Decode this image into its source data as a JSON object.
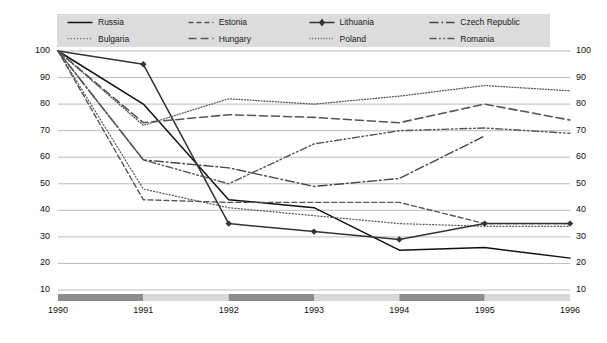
{
  "legend": {
    "items": [
      {
        "name": "Russia",
        "style": "solid",
        "color": "#111111",
        "marker": "none"
      },
      {
        "name": "Bulgaria",
        "style": "fine-dotted",
        "color": "#555555",
        "marker": "none"
      },
      {
        "name": "Estonia",
        "style": "dashed",
        "color": "#555555",
        "marker": "none"
      },
      {
        "name": "Hungary",
        "style": "long-dash",
        "color": "#555555",
        "marker": "none"
      },
      {
        "name": "Lithuania",
        "style": "solid",
        "color": "#333333",
        "marker": "diamond"
      },
      {
        "name": "Poland",
        "style": "dotted",
        "color": "#555555",
        "marker": "none"
      },
      {
        "name": "Czech Republic",
        "style": "dash-dot",
        "color": "#444444",
        "marker": "none"
      },
      {
        "name": "Romania",
        "style": "dash-dot-dot",
        "color": "#555555",
        "marker": "none"
      }
    ]
  },
  "axes": {
    "y_ticks_left": [
      "100",
      "90",
      "80",
      "70",
      "60",
      "50",
      "40",
      "30",
      "20",
      "10"
    ],
    "y_ticks_right": [
      "100",
      "90",
      "80",
      "70",
      "60",
      "50",
      "40",
      "30",
      "20",
      "10"
    ],
    "x_ticks": [
      "1990",
      "1991",
      "1992",
      "1993",
      "1994",
      "1995",
      "1996"
    ]
  },
  "colors": {
    "legend_background": "#dcdcdc",
    "gridline": "#b4b4b4",
    "band_dark": "#8c8c8c",
    "band_light": "#d8d8d8",
    "text": "#111111"
  },
  "timeline_band": {
    "segments": [
      {
        "from": "1990",
        "to": "1991",
        "shade": "dark"
      },
      {
        "from": "1991",
        "to": "1992",
        "shade": "light"
      },
      {
        "from": "1992",
        "to": "1993",
        "shade": "dark"
      },
      {
        "from": "1993",
        "to": "1994",
        "shade": "light"
      },
      {
        "from": "1994",
        "to": "1995",
        "shade": "dark"
      },
      {
        "from": "1995",
        "to": "1996",
        "shade": "light"
      }
    ]
  },
  "chart_data": {
    "type": "line",
    "title": "",
    "subtitle": "",
    "xlabel": "",
    "ylabel": "",
    "x": [
      1990,
      1991,
      1992,
      1993,
      1994,
      1995,
      1996
    ],
    "categories": [
      "1990",
      "1991",
      "1992",
      "1993",
      "1994",
      "1995",
      "1996"
    ],
    "ylim": [
      10,
      100
    ],
    "xlim": [
      1990,
      1996
    ],
    "ytick_step": 10,
    "grid": true,
    "legend_position": "top",
    "series": [
      {
        "name": "Russia",
        "values": [
          100,
          80,
          44,
          41,
          25,
          26,
          22
        ]
      },
      {
        "name": "Bulgaria",
        "values": [
          100,
          48,
          41,
          38,
          35,
          34,
          34
        ]
      },
      {
        "name": "Estonia",
        "values": [
          100,
          44,
          43,
          43,
          43,
          35,
          35
        ]
      },
      {
        "name": "Hungary",
        "values": [
          100,
          73,
          76,
          75,
          73,
          80,
          74
        ]
      },
      {
        "name": "Lithuania",
        "values": [
          100,
          95,
          35,
          32,
          29,
          35,
          35
        ]
      },
      {
        "name": "Poland",
        "values": [
          100,
          72,
          82,
          80,
          83,
          87,
          85
        ]
      },
      {
        "name": "Czech Republic",
        "values": [
          100,
          59,
          56,
          49,
          52,
          68,
          null
        ]
      },
      {
        "name": "Romania",
        "values": [
          100,
          59,
          50,
          65,
          70,
          71,
          69
        ]
      }
    ]
  }
}
